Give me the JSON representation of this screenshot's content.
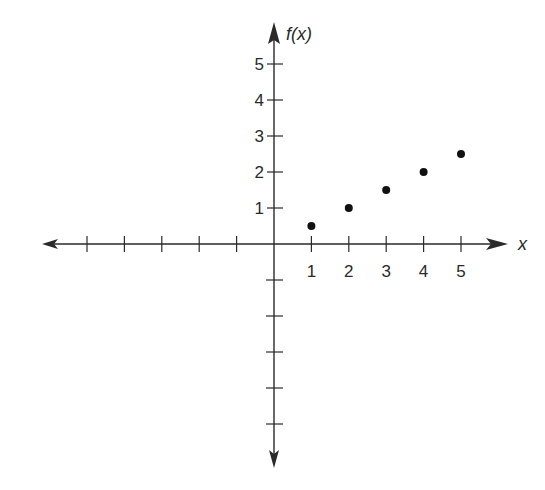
{
  "chart_data": {
    "type": "scatter",
    "title": "",
    "xlabel": "x",
    "ylabel": "f(x)",
    "x": [
      1,
      2,
      3,
      4,
      5
    ],
    "series": [
      {
        "name": "f(x)",
        "values": [
          0.5,
          1,
          1.5,
          2,
          2.5
        ]
      }
    ],
    "x_tick_labels": [
      "1",
      "2",
      "3",
      "4",
      "5"
    ],
    "y_tick_labels": [
      "1",
      "2",
      "3",
      "4",
      "5"
    ],
    "x_ticks_negative_count": 5,
    "y_ticks_negative_count": 5,
    "xlim": [
      -6,
      6
    ],
    "ylim": [
      -6,
      5.5
    ],
    "grid": false,
    "legend": "none",
    "axes_style": "cartesian-arrows",
    "colors": {
      "axis": "#2a2a2a",
      "points": "#111111"
    }
  }
}
